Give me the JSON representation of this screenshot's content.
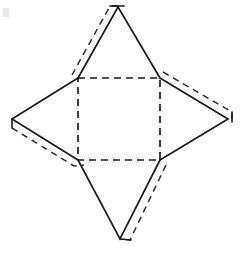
{
  "figure": {
    "background_color": "#ffffff",
    "stroke_color": "#1a1a1a",
    "canvas": {
      "width": 243,
      "height": 260
    },
    "base": {
      "name": "square-base",
      "line_style": "dashed",
      "corners": {
        "top_left": [
          78,
          78
        ],
        "top_right": [
          160,
          78
        ],
        "bottom_right": [
          160,
          160
        ],
        "bottom_left": [
          78,
          160
        ]
      },
      "path": "M 78 78 L 160 78 L 160 160 L 78 160 Z"
    },
    "triangles": [
      {
        "name": "top-triangle",
        "line_style": "solid",
        "apex": [
          118,
          7
        ],
        "base_left": [
          78,
          78
        ],
        "base_right": [
          160,
          78
        ],
        "path": "M 78 78 L 118 7 L 160 78",
        "flap": {
          "name": "top-triangle-flap",
          "line_style": "dashed",
          "path": "M 72 75 L 110 6 L 124 6"
        }
      },
      {
        "name": "right-triangle",
        "line_style": "solid",
        "apex": [
          228,
          119
        ],
        "base_top": [
          160,
          78
        ],
        "base_bottom": [
          160,
          160
        ],
        "path": "M 160 78 L 228 119 L 160 160",
        "flap": {
          "name": "right-triangle-flap",
          "line_style": "dashed",
          "path": "M 163 72 L 232 112 L 232 122"
        }
      },
      {
        "name": "bottom-triangle",
        "line_style": "solid",
        "apex": [
          120,
          239
        ],
        "base_right": [
          160,
          160
        ],
        "base_left": [
          78,
          160
        ],
        "path": "M 160 160 L 120 239 L 78 160",
        "flap": {
          "name": "bottom-triangle-flap",
          "line_style": "dashed",
          "path": "M 166 165 L 130 240 L 120 239"
        }
      },
      {
        "name": "left-triangle",
        "line_style": "solid",
        "apex": [
          12,
          119
        ],
        "base_bottom": [
          78,
          160
        ],
        "base_top": [
          78,
          78
        ],
        "path": "M 78 160 L 12 119 L 78 78",
        "flap": {
          "name": "left-triangle-flap",
          "line_style": "dashed",
          "path": "M 12 128 L 74 166 L 84 165"
        }
      }
    ],
    "corner_ticks": [
      {
        "name": "left-apex-tick",
        "path": "M 12 119 L 12 128"
      },
      {
        "name": "right-apex-tick",
        "path": "M 232 112 L 232 122"
      },
      {
        "name": "top-apex-tick",
        "path": "M 110 6 L 124 6"
      },
      {
        "name": "bottom-apex-tick",
        "path": "M 120 239 L 131 240"
      }
    ],
    "artifact": {
      "name": "scan-speck",
      "x": 3,
      "y": 8,
      "width": 6,
      "height": 9
    }
  }
}
